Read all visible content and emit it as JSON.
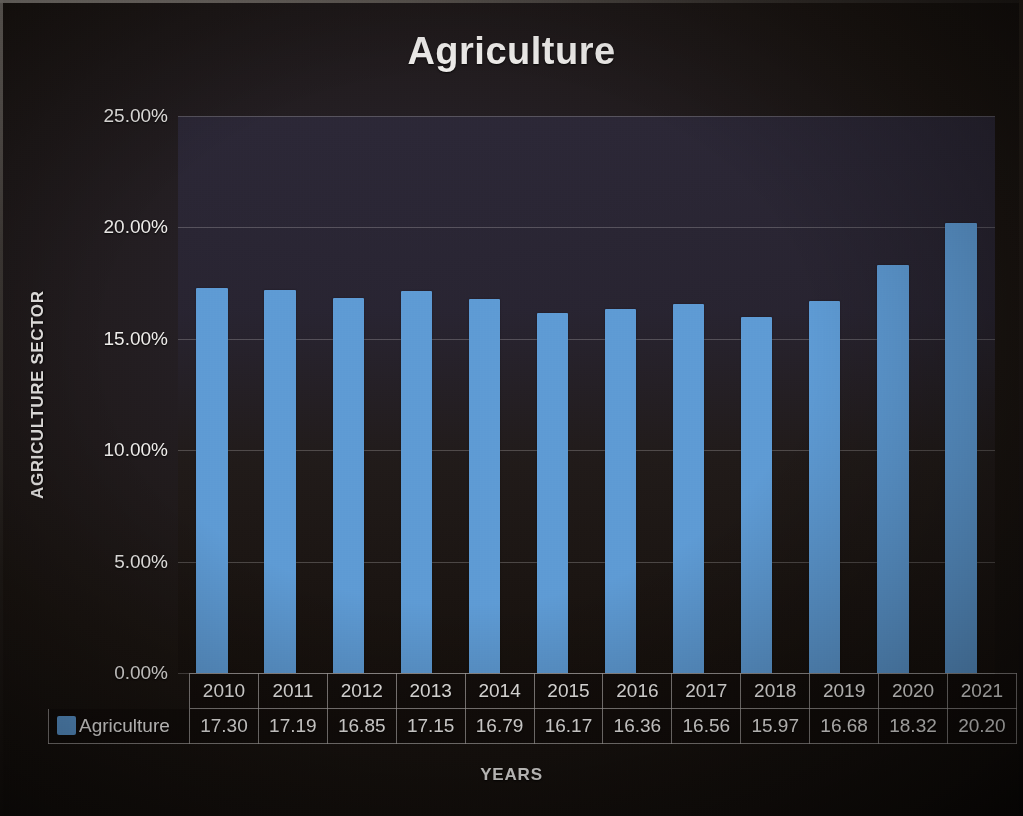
{
  "chart_data": {
    "type": "bar",
    "title": "Agriculture",
    "xlabel": "YEARS",
    "ylabel": "AGRICULTURE SECTOR",
    "categories": [
      "2010",
      "2011",
      "2012",
      "2013",
      "2014",
      "2015",
      "2016",
      "2017",
      "2018",
      "2019",
      "2020",
      "2021"
    ],
    "values": [
      17.3,
      17.19,
      16.85,
      17.15,
      16.79,
      16.17,
      16.36,
      16.56,
      15.97,
      16.68,
      18.32,
      20.2
    ],
    "value_labels": [
      "17.30",
      "17.19",
      "16.85",
      "17.15",
      "16.79",
      "16.17",
      "16.36",
      "16.56",
      "15.97",
      "16.68",
      "18.32",
      "20.20"
    ],
    "series": [
      {
        "name": "Agriculture",
        "color": "#5D9AD4",
        "values": [
          17.3,
          17.19,
          16.85,
          17.15,
          16.79,
          16.17,
          16.36,
          16.56,
          15.97,
          16.68,
          18.32,
          20.2
        ]
      }
    ],
    "ylim": [
      0,
      25
    ],
    "ytick_values": [
      0,
      5,
      10,
      15,
      20,
      25
    ],
    "ytick_labels": [
      "0.00%",
      "5.00%",
      "10.00%",
      "15.00%",
      "20.00%",
      "25.00%"
    ],
    "grid": true,
    "legend_position": "bottom-left-data-table",
    "data_table_visible": true,
    "unit": "percent"
  },
  "legend": {
    "entries": [
      {
        "label": "Agriculture",
        "color": "#5D9AD4",
        "swatch": "blue-square-swatch"
      }
    ]
  },
  "colors": {
    "bar": "#5D9AD4",
    "plot_background": "#282838",
    "slide_background": "#16110D",
    "text": "#F1EFED",
    "gridline": "#BEB9B9"
  }
}
